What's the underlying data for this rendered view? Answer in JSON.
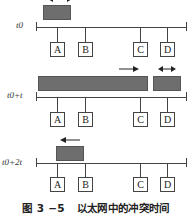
{
  "figure": {
    "caption_number": "图 3 −5",
    "caption_text": "以太网中的冲突时间",
    "stations": [
      "A",
      "B",
      "C",
      "D"
    ],
    "rows": [
      {
        "time_label": "t0",
        "frames": [
          {
            "from": "A",
            "description": "frame sent by A near A"
          }
        ],
        "arrows": [
          "double-arrow-top (partially cropped)"
        ]
      },
      {
        "time_label": "t0+t",
        "frames": [
          {
            "from": "A",
            "description": "frame from A extending to C",
            "arrow": "right"
          },
          {
            "from": "D",
            "description": "frame sent by D",
            "arrow": "double"
          }
        ]
      },
      {
        "time_label": "t0+2t",
        "frames": [
          {
            "from": "A",
            "description": "collision signal returning to A",
            "arrow": "left"
          }
        ]
      }
    ],
    "colors": {
      "frame": "#6e6e6e",
      "line": "#444444",
      "background": "#ffffff"
    }
  }
}
